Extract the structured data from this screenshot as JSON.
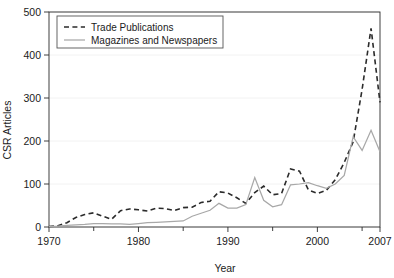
{
  "chart_data": {
    "type": "line",
    "title": "",
    "xlabel": "Year",
    "ylabel": "CSR Articles",
    "xlim": [
      1970,
      2007
    ],
    "ylim": [
      0,
      500
    ],
    "grid": true,
    "legend_position": "top-left",
    "x_ticks": [
      {
        "value": 1970,
        "label": "1970",
        "major": true
      },
      {
        "value": 1975,
        "label": "",
        "major": false
      },
      {
        "value": 1980,
        "label": "1980",
        "major": true
      },
      {
        "value": 1985,
        "label": "",
        "major": false
      },
      {
        "value": 1990,
        "label": "1990",
        "major": true
      },
      {
        "value": 1995,
        "label": "",
        "major": false
      },
      {
        "value": 2000,
        "label": "2000",
        "major": true
      },
      {
        "value": 2005,
        "label": "",
        "major": false
      },
      {
        "value": 2007,
        "label": "2007",
        "major": true
      }
    ],
    "y_ticks": [
      {
        "value": 0,
        "label": "0"
      },
      {
        "value": 100,
        "label": "100"
      },
      {
        "value": 200,
        "label": "200"
      },
      {
        "value": 300,
        "label": "300"
      },
      {
        "value": 400,
        "label": "400"
      },
      {
        "value": 500,
        "label": "500"
      }
    ],
    "x": [
      1970,
      1971,
      1972,
      1973,
      1974,
      1975,
      1976,
      1977,
      1978,
      1979,
      1980,
      1981,
      1982,
      1983,
      1984,
      1985,
      1986,
      1987,
      1988,
      1989,
      1990,
      1991,
      1992,
      1993,
      1994,
      1995,
      1996,
      1997,
      1998,
      1999,
      2000,
      2001,
      2002,
      2003,
      2004,
      2005,
      2006,
      2007
    ],
    "series": [
      {
        "name": "Trade Publications",
        "style": "dashed",
        "color": "#2b2b2b",
        "values": [
          1,
          3,
          10,
          22,
          29,
          33,
          25,
          18,
          38,
          42,
          40,
          37,
          44,
          43,
          38,
          45,
          46,
          57,
          60,
          82,
          79,
          68,
          55,
          80,
          95,
          75,
          78,
          135,
          130,
          86,
          78,
          85,
          110,
          150,
          198,
          320,
          462,
          290
        ]
      },
      {
        "name": "Magazines and Newspapers",
        "style": "solid",
        "color": "#a8a8a8",
        "values": [
          1,
          2,
          4,
          5,
          6,
          8,
          8,
          7,
          7,
          6,
          8,
          10,
          11,
          12,
          13,
          14,
          25,
          32,
          39,
          55,
          44,
          44,
          52,
          115,
          62,
          47,
          52,
          98,
          100,
          103,
          96,
          90,
          100,
          120,
          210,
          178,
          225,
          175
        ]
      }
    ],
    "legend": [
      {
        "label": "Trade Publications",
        "style": "dashed",
        "color": "#2b2b2b"
      },
      {
        "label": "Magazines and Newspapers",
        "style": "solid",
        "color": "#a8a8a8"
      }
    ]
  }
}
